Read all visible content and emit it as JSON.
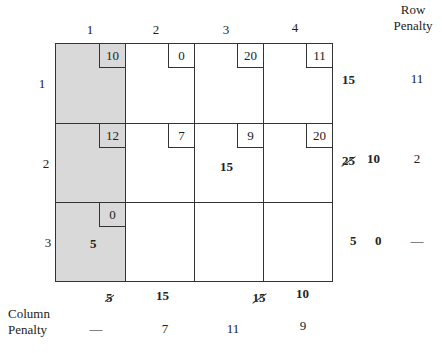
{
  "header": {
    "column_labels": [
      "1",
      "2",
      "3",
      "4"
    ],
    "row_penalty_title_line1": "Row",
    "row_penalty_title_line2": "Penalty"
  },
  "rows": [
    {
      "label": "1",
      "cells": [
        {
          "cost": "10",
          "alloc": "",
          "shaded": true
        },
        {
          "cost": "0",
          "alloc": "",
          "shaded": false
        },
        {
          "cost": "20",
          "alloc": "",
          "shaded": false
        },
        {
          "cost": "11",
          "alloc": "",
          "shaded": false
        }
      ],
      "supply": [
        {
          "value": "15",
          "crossed": false
        }
      ],
      "row_penalty": "11"
    },
    {
      "label": "2",
      "cells": [
        {
          "cost": "12",
          "alloc": "",
          "shaded": true
        },
        {
          "cost": "7",
          "alloc": "",
          "shaded": false
        },
        {
          "cost": "9",
          "alloc": "15",
          "shaded": false
        },
        {
          "cost": "20",
          "alloc": "",
          "shaded": false
        }
      ],
      "supply": [
        {
          "value": "25",
          "crossed": true
        },
        {
          "value": "10",
          "crossed": false
        }
      ],
      "row_penalty": "2"
    },
    {
      "label": "3",
      "cells": [
        {
          "cost": "0",
          "alloc": "5",
          "shaded": true
        },
        {
          "cost": "",
          "alloc": "",
          "shaded": false
        },
        {
          "cost": "",
          "alloc": "",
          "shaded": false
        },
        {
          "cost": "",
          "alloc": "",
          "shaded": false
        }
      ],
      "supply": [
        {
          "value": "5",
          "crossed": false
        },
        {
          "value": "0",
          "crossed": false
        }
      ],
      "row_penalty": "—"
    }
  ],
  "demand": [
    {
      "value": "5",
      "crossed": true
    },
    {
      "value": "15",
      "crossed": false
    },
    {
      "value": "15",
      "crossed": true
    },
    {
      "value": "10",
      "crossed": false
    }
  ],
  "column_penalty": {
    "title_line1": "Column",
    "title_line2": "Penalty",
    "values": [
      "—",
      "7",
      "11",
      "9"
    ]
  },
  "colors": {
    "shaded": "#d9d9d9",
    "line": "#333333",
    "background": "#ffffff"
  }
}
